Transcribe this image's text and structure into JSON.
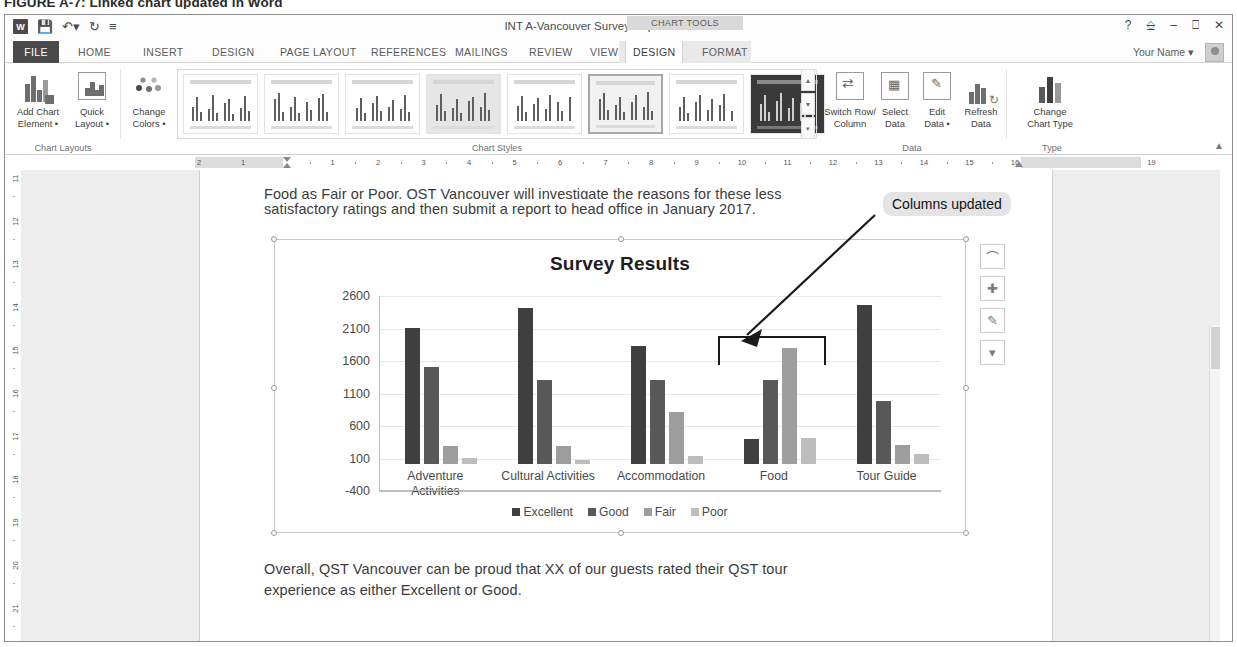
{
  "figure": {
    "caption": "FIGURE A-7: Linked chart updated in Word"
  },
  "titlebar": {
    "document_title": "INT A-Vancouver Survey Report.docx - Word",
    "contextual_tab_group": "CHART TOOLS",
    "quick_access": [
      "word-logo",
      "save-icon",
      "undo-icon",
      "redo-icon",
      "customize-qat-icon"
    ],
    "window_controls": [
      "help",
      "ribbon-display-options",
      "minimize",
      "restore",
      "close"
    ],
    "user_name": "Your Name"
  },
  "tabs": {
    "file": "FILE",
    "items": [
      "HOME",
      "INSERT",
      "DESIGN",
      "PAGE LAYOUT",
      "REFERENCES",
      "MAILINGS",
      "REVIEW",
      "VIEW"
    ],
    "chart_tools": [
      "DESIGN",
      "FORMAT"
    ],
    "active": "DESIGN"
  },
  "ribbon": {
    "groups": [
      {
        "title": "Chart Layouts",
        "buttons": [
          "Add Chart Element",
          "Quick Layout"
        ]
      },
      {
        "title": "Chart Styles",
        "buttons": [
          "Change Colors"
        ]
      },
      {
        "title": "Data",
        "buttons": [
          "Switch Row/ Column",
          "Select Data",
          "Edit Data",
          "Refresh Data"
        ]
      },
      {
        "title": "Type",
        "buttons": [
          "Change Chart Type"
        ]
      }
    ],
    "chart_layouts": {
      "add_chart_element": "Add Chart\nElement",
      "quick_layout": "Quick\nLayout",
      "title": "Chart Layouts"
    },
    "change_colors": "Change\nColors",
    "styles_title": "Chart Styles",
    "styles_count": 8,
    "styles_selected_index": 5,
    "data": {
      "switch_row_column": "Switch Row/\nColumn",
      "select_data": "Select\nData",
      "edit_data": "Edit\nData",
      "refresh_data": "Refresh\nData",
      "title": "Data"
    },
    "type": {
      "change_chart_type": "Change\nChart Type",
      "title": "Type"
    }
  },
  "ruler": {
    "horizontal_margin_labels": [
      "2",
      "1"
    ],
    "horizontal_labels": [
      "1",
      "2",
      "3",
      "4",
      "5",
      "6",
      "7",
      "8",
      "9",
      "10",
      "11",
      "12",
      "13",
      "14",
      "15",
      "16",
      "17",
      "18",
      "19"
    ],
    "vertical_labels": [
      "11",
      "12",
      "13",
      "14",
      "15",
      "16",
      "17",
      "18",
      "19",
      "20",
      "21"
    ]
  },
  "document": {
    "paragraph_top_line1": "Food as Fair or Poor. QST Vancouver will investigate the reasons for these less",
    "paragraph_top_line1_prefix": "Food as ",
    "paragraph_top_line1_spell": "Fair",
    "paragraph_top_line1_rest": " or Poor. QST Vancouver will investigate the reasons for these less",
    "paragraph_top_line2": "satisfactory ratings and then submit a report to head office in January 2017.",
    "paragraph_bottom_line1": "Overall, QST Vancouver can be proud that XX of our guests rated their QST tour",
    "paragraph_bottom_line2": "experience as either Excellent or Good."
  },
  "annotation": {
    "callout_text": "Columns updated"
  },
  "chart_buttons": [
    {
      "name": "layout-options-icon",
      "glyph": "⌒"
    },
    {
      "name": "chart-elements-icon",
      "glyph": "✚"
    },
    {
      "name": "chart-styles-icon",
      "glyph": "✎"
    },
    {
      "name": "chart-filters-icon",
      "glyph": "▽"
    }
  ],
  "chart_data": {
    "type": "bar",
    "title": "Survey Results",
    "categories": [
      "Adventure Activities",
      "Cultural Activities",
      "Accommodation",
      "Food",
      "Tour Guide"
    ],
    "category_labels": [
      [
        "Adventure",
        "Activities"
      ],
      [
        "Cultural Activities"
      ],
      [
        "Accommodation"
      ],
      [
        "Food"
      ],
      [
        "Tour Guide"
      ]
    ],
    "series": [
      {
        "name": "Excellent",
        "color": "#3f3f3f",
        "values": [
          2100,
          2400,
          1820,
          380,
          2450
        ]
      },
      {
        "name": "Good",
        "color": "#585858",
        "values": [
          1500,
          1300,
          1300,
          1300,
          970
        ]
      },
      {
        "name": "Fair",
        "color": "#9e9e9e",
        "values": [
          280,
          270,
          800,
          1790,
          300
        ]
      },
      {
        "name": "Poor",
        "color": "#bdbdbd",
        "values": [
          100,
          60,
          130,
          400,
          150
        ]
      }
    ],
    "ylim": [
      -400,
      2600
    ],
    "yticks": [
      -400,
      100,
      600,
      1100,
      1600,
      2100,
      2600
    ],
    "ytick_labels": [
      "-400",
      "100",
      "600",
      "1100",
      "1600",
      "2100",
      "2600"
    ],
    "xlabel": "",
    "ylabel": "",
    "grid": true,
    "legend": [
      "Excellent",
      "Good",
      "Fair",
      "Poor"
    ],
    "legend_position": "bottom"
  }
}
